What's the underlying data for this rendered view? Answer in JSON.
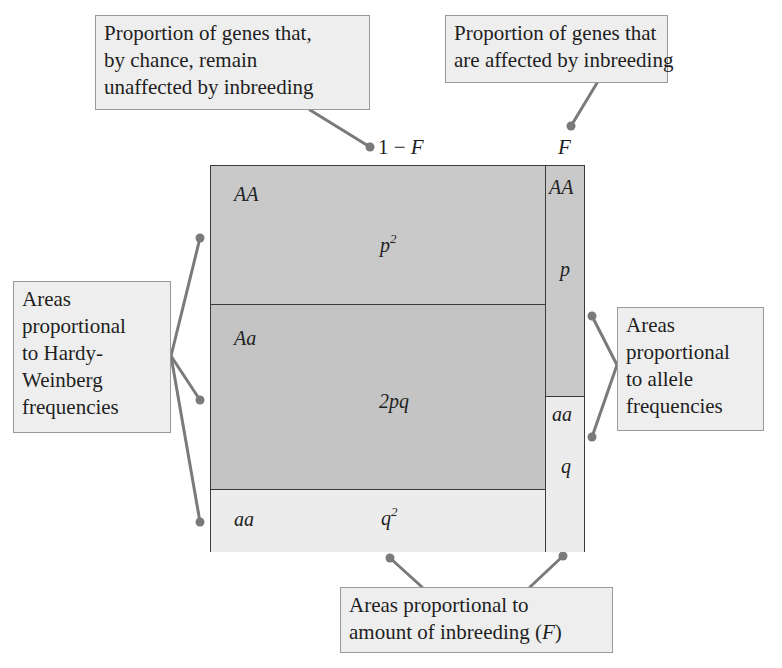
{
  "diagram": {
    "type": "area-proportion diagram (inbreeding and Hardy-Weinberg genotype frequencies)",
    "colors": {
      "dark_fill": "#c9c9c9",
      "light_fill": "#ececec",
      "callout_fill": "#eeeeee",
      "connector": "#7a7a7a",
      "border": "#3a3a3a"
    }
  },
  "axis": {
    "left_column_label_one": "1",
    "left_column_label_minus": " − ",
    "left_column_label_F": "F",
    "right_column_label": "F"
  },
  "callouts": {
    "unaffected": {
      "lines": [
        "Proportion of genes that,",
        "by chance, remain",
        "unaffected by inbreeding"
      ]
    },
    "affected": {
      "lines": [
        "Proportion of genes that",
        "are affected by inbreeding"
      ]
    },
    "hardy_weinberg": {
      "lines": [
        "Areas",
        "proportional",
        "to Hardy-",
        "Weinberg",
        "frequencies"
      ]
    },
    "allele": {
      "lines": [
        "Areas",
        "proportional",
        "to allele",
        "frequencies"
      ]
    },
    "inbreeding": {
      "lines": [
        "Areas proportional to",
        "amount of inbreeding ("
      ],
      "italic_F": "F",
      "close_paren": ")"
    }
  },
  "cells": {
    "left_AA": {
      "genotype": "AA",
      "freq_base": "p",
      "freq_exp": "2"
    },
    "left_Aa": {
      "genotype": "Aa",
      "freq": "2pq"
    },
    "left_aa": {
      "genotype": "aa",
      "freq_base": "q",
      "freq_exp": "2"
    },
    "right_AA": {
      "genotype": "AA",
      "freq": "p"
    },
    "right_aa": {
      "genotype": "aa",
      "freq": "q"
    }
  }
}
